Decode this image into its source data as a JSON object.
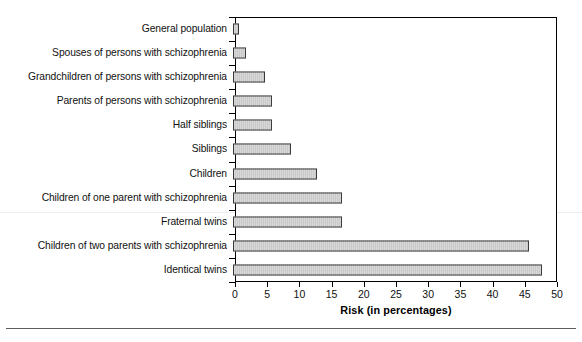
{
  "chart_data": {
    "type": "bar",
    "orientation": "horizontal",
    "title": "",
    "xlabel": "Risk (in percentages)",
    "ylabel": "",
    "xlim": [
      0,
      50
    ],
    "xticks": [
      0,
      5,
      10,
      15,
      20,
      25,
      30,
      35,
      40,
      45,
      50
    ],
    "grid": false,
    "legend": null,
    "categories": [
      "General population",
      "Spouses of persons with schizophrenia",
      "Grandchildren of persons with schizophrenia",
      "Parents of persons with schizophrenia",
      "Half siblings",
      "Siblings",
      "Children",
      "Children of one parent with schizophrenia",
      "Fraternal twins",
      "Children of two parents with schizophrenia",
      "Identical twins"
    ],
    "values": [
      1,
      2,
      5,
      6,
      6,
      9,
      13,
      17,
      17,
      46,
      48
    ],
    "bar_fill": "#c9c9c9",
    "bar_edge": "#3a3a3a"
  },
  "axis": {
    "x_label": "Risk (in percentages)",
    "tick_labels": [
      "0",
      "5",
      "10",
      "15",
      "20",
      "25",
      "30",
      "35",
      "40",
      "45",
      "50"
    ]
  }
}
